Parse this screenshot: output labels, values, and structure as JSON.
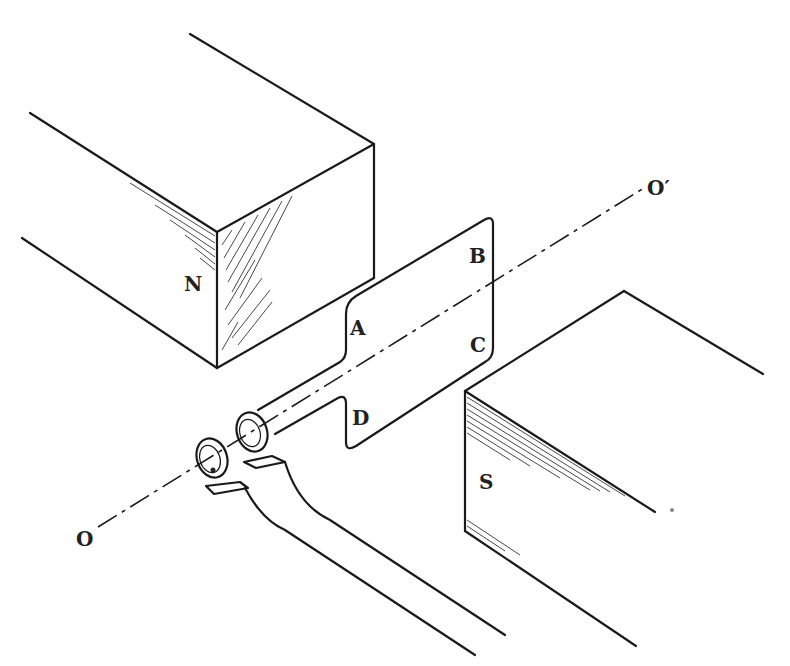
{
  "figure": {
    "labels": {
      "north_pole": "N",
      "south_pole": "S",
      "corner_a": "A",
      "corner_b": "B",
      "corner_c": "C",
      "corner_d": "D",
      "axis_start": "O",
      "axis_end": "O′"
    }
  }
}
